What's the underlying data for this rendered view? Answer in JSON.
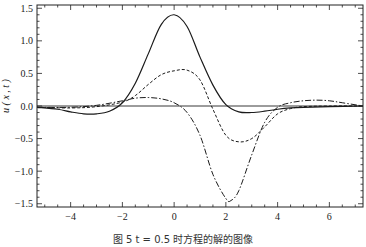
{
  "chart_data": {
    "type": "line",
    "title": "",
    "xlabel": "x",
    "ylabel": "u ( x , t )",
    "xlim": [
      -5.3,
      7.3
    ],
    "ylim": [
      -1.55,
      1.55
    ],
    "xticks": [
      -4,
      -2,
      0,
      2,
      4,
      6
    ],
    "xtick_labels": [
      "−4",
      "−2",
      "0",
      "2",
      "4",
      "6"
    ],
    "yticks": [
      1.5,
      1.0,
      0.5,
      0.0,
      -0.5,
      -1.0,
      -1.5
    ],
    "ytick_labels": [
      "1.5",
      "1.0",
      "0.5",
      "0.0",
      "−0.5",
      "−1.0",
      "−1.5"
    ],
    "grid": false,
    "legend": null,
    "reference_line": {
      "y": 0.0,
      "style": "solid"
    },
    "series": [
      {
        "name": "solid",
        "style": "solid",
        "x": [
          -5.3,
          -4.5,
          -4.0,
          -3.5,
          -3.0,
          -2.5,
          -2.0,
          -1.5,
          -1.0,
          -0.5,
          0.0,
          0.5,
          1.0,
          1.5,
          2.0,
          2.5,
          3.0,
          3.5,
          4.0,
          4.5,
          5.0,
          6.0,
          7.3
        ],
        "y": [
          -0.02,
          -0.05,
          -0.09,
          -0.12,
          -0.12,
          -0.08,
          0.05,
          0.35,
          0.8,
          1.25,
          1.4,
          1.22,
          0.75,
          0.32,
          0.02,
          -0.09,
          -0.1,
          -0.08,
          -0.05,
          -0.03,
          -0.02,
          -0.01,
          0.0
        ]
      },
      {
        "name": "dashed",
        "style": "dashed",
        "x": [
          -5.3,
          -4.0,
          -3.0,
          -2.0,
          -1.5,
          -1.0,
          -0.5,
          0.0,
          0.5,
          1.0,
          1.5,
          2.0,
          2.5,
          3.0,
          3.5,
          4.0,
          4.5,
          5.0,
          6.0,
          7.3
        ],
        "y": [
          -0.02,
          -0.03,
          -0.01,
          0.06,
          0.16,
          0.33,
          0.48,
          0.54,
          0.55,
          0.4,
          -0.05,
          -0.45,
          -0.55,
          -0.5,
          -0.32,
          -0.12,
          -0.04,
          -0.01,
          0.0,
          0.0
        ]
      },
      {
        "name": "dash-dot",
        "style": "dashdot",
        "x": [
          -5.3,
          -4.0,
          -3.0,
          -2.0,
          -1.5,
          -1.0,
          -0.5,
          0.0,
          0.5,
          1.0,
          1.5,
          2.0,
          2.2,
          2.5,
          3.0,
          3.5,
          4.0,
          4.5,
          5.0,
          5.5,
          6.0,
          6.5,
          7.3
        ],
        "y": [
          -0.02,
          -0.02,
          0.01,
          0.08,
          0.12,
          0.13,
          0.11,
          0.05,
          -0.1,
          -0.45,
          -1.05,
          -1.42,
          -1.45,
          -1.3,
          -0.75,
          -0.25,
          -0.02,
          0.05,
          0.08,
          0.09,
          0.08,
          0.05,
          0.0
        ]
      }
    ]
  },
  "caption": "图 5  t = 0.5 时方程的解的图像"
}
